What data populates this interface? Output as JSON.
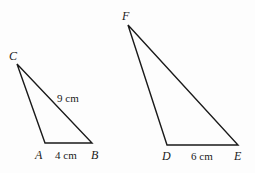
{
  "diagram": {
    "type": "similar-triangles",
    "triangles": [
      {
        "name": "triangle-ABC",
        "vertices": {
          "C": {
            "label": "C",
            "x": 17,
            "y": 64
          },
          "A": {
            "label": "A",
            "x": 45,
            "y": 143
          },
          "B": {
            "label": "B",
            "x": 92,
            "y": 143
          }
        },
        "side_labels": {
          "AB": "4 cm",
          "CB": "9 cm"
        }
      },
      {
        "name": "triangle-DEF",
        "vertices": {
          "F": {
            "label": "F",
            "x": 128,
            "y": 25
          },
          "D": {
            "label": "D",
            "x": 167,
            "y": 145
          },
          "E": {
            "label": "E",
            "x": 238,
            "y": 145
          }
        },
        "side_labels": {
          "DE": "6 cm"
        }
      }
    ],
    "colors": {
      "line": "#1a1a1a",
      "background": "#fdfdfd"
    }
  }
}
